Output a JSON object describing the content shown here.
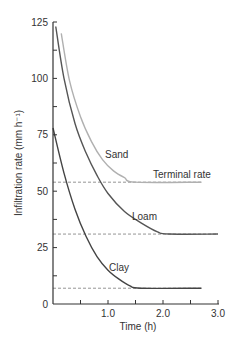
{
  "chart_data": {
    "type": "line",
    "title": "",
    "xlabel": "Time (h)",
    "ylabel": "Infiltration rate (mm h⁻¹)",
    "xlim": [
      0,
      3.0
    ],
    "ylim": [
      0,
      125
    ],
    "x_ticks": [
      "1.0",
      "2.0",
      "3.0"
    ],
    "y_ticks": [
      "0",
      "25",
      "50",
      "75",
      "100",
      "125"
    ],
    "grid": false,
    "annotations": [
      "Terminal rate"
    ],
    "series": [
      {
        "name": "Sand",
        "color": "#b0b0b0",
        "terminal_rate": 54,
        "x": [
          0.15,
          0.3,
          0.5,
          0.7,
          0.9,
          1.1,
          1.3,
          1.5,
          2.7
        ],
        "y": [
          120,
          99,
          83,
          72,
          64,
          59,
          56,
          54,
          54
        ]
      },
      {
        "name": "Loam",
        "color": "#555555",
        "terminal_rate": 31,
        "x": [
          0.05,
          0.2,
          0.4,
          0.6,
          0.8,
          1.0,
          1.3,
          1.6,
          1.9,
          2.1,
          3.0
        ],
        "y": [
          123,
          100,
          80,
          67,
          57,
          49,
          41,
          36,
          32,
          31,
          31
        ]
      },
      {
        "name": "Clay",
        "color": "#444444",
        "terminal_rate": 7,
        "x": [
          0.0,
          0.2,
          0.4,
          0.6,
          0.8,
          1.0,
          1.2,
          1.4,
          1.6,
          2.7
        ],
        "y": [
          78,
          58,
          42,
          30,
          21,
          15,
          11,
          8,
          7,
          7
        ]
      }
    ]
  },
  "labels": {
    "sand": "Sand",
    "loam": "Loam",
    "clay": "Clay",
    "terminal": "Terminal rate",
    "xlabel": "Time (h)",
    "ylabel": "Infiltration rate (mm h⁻¹)",
    "xt1": "1.0",
    "xt2": "2.0",
    "xt3": "3.0",
    "yt0": "0",
    "yt25": "25",
    "yt50": "50",
    "yt75": "75",
    "yt100": "100",
    "yt125": "125"
  }
}
